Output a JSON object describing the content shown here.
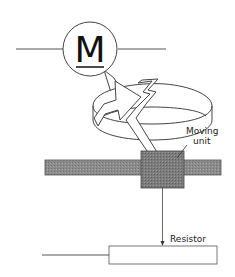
{
  "diagram": {
    "motor": {
      "symbol": "M"
    },
    "labels": {
      "moving_unit_line1": "Moving",
      "moving_unit_line2": "unit",
      "resistor": "Resistor"
    },
    "colors": {
      "stroke": "#333333",
      "bar_fill": "#8a8a8a",
      "unit_fill": "#7a7a7a",
      "background": "#ffffff"
    }
  }
}
